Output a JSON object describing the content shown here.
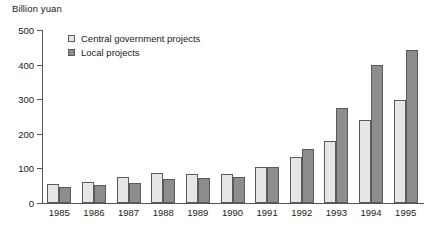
{
  "chart_data": {
    "type": "bar",
    "title": "",
    "ylabel": "Billion yuan",
    "xlabel": "",
    "ylim": [
      0,
      500
    ],
    "ytick_values": [
      0,
      100,
      200,
      300,
      400,
      500
    ],
    "ytick_labels": [
      "0",
      "100",
      "200",
      "300",
      "400",
      "500"
    ],
    "grid": false,
    "legend_position": "top-left-inside",
    "categories": [
      "1985",
      "1986",
      "1987",
      "1988",
      "1989",
      "1990",
      "1991",
      "1992",
      "1993",
      "1994",
      "1995"
    ],
    "series": [
      {
        "name": "Central government projects",
        "color": "#e6e6e6",
        "values": [
          55,
          62,
          75,
          87,
          83,
          85,
          105,
          132,
          180,
          240,
          298
        ]
      },
      {
        "name": "Local projects",
        "color": "#8d8d8d",
        "values": [
          47,
          53,
          58,
          68,
          72,
          75,
          105,
          155,
          275,
          400,
          443
        ]
      }
    ]
  },
  "legend": {
    "items": [
      {
        "label": "Central government projects",
        "swatch": "central"
      },
      {
        "label": "Local projects",
        "swatch": "local"
      }
    ]
  }
}
